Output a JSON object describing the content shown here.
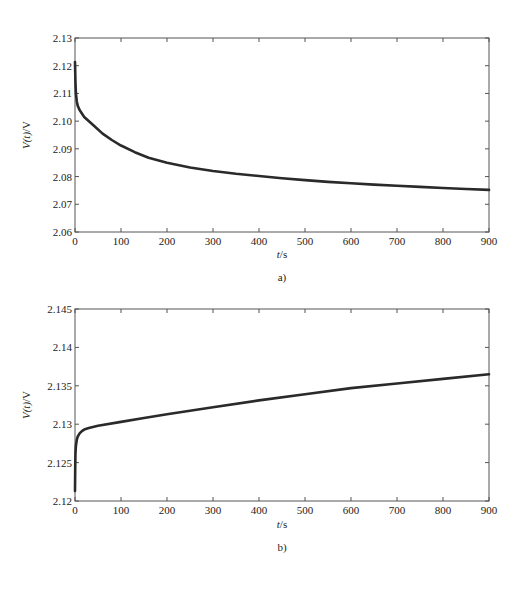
{
  "chart_data": [
    {
      "id": "a",
      "type": "line",
      "title": "",
      "caption": "a)",
      "xlabel_var": "t",
      "xlabel_unit": "/s",
      "ylabel_var": "V",
      "ylabel_arg": "(t)",
      "ylabel_unit": "/V",
      "xlim": [
        0,
        900
      ],
      "ylim": [
        2.06,
        2.13
      ],
      "xticks": [
        0,
        100,
        200,
        300,
        400,
        500,
        600,
        700,
        800,
        900
      ],
      "xtick_labels": [
        "0",
        "100",
        "200",
        "300",
        "400",
        "500",
        "600",
        "700",
        "800",
        "900"
      ],
      "yticks": [
        2.06,
        2.07,
        2.08,
        2.09,
        2.1,
        2.11,
        2.12,
        2.13
      ],
      "ytick_labels": [
        "2.06",
        "2.07",
        "2.08",
        "2.09",
        "2.10",
        "2.11",
        "2.12",
        "2.13"
      ],
      "grid": false,
      "legend": null,
      "series": [
        {
          "name": "V(t)",
          "color": "#2a2a2a",
          "x": [
            0,
            1,
            2,
            4,
            6,
            10,
            20,
            40,
            60,
            80,
            100,
            130,
            160,
            200,
            250,
            300,
            350,
            400,
            450,
            500,
            550,
            600,
            650,
            700,
            750,
            800,
            850,
            900
          ],
          "y": [
            2.1213,
            2.114,
            2.11,
            2.107,
            2.1055,
            2.104,
            2.1015,
            2.0985,
            2.0955,
            2.0932,
            2.0912,
            2.0888,
            2.0868,
            2.085,
            2.0833,
            2.082,
            2.081,
            2.0802,
            2.0794,
            2.0787,
            2.0781,
            2.0776,
            2.0771,
            2.0767,
            2.0763,
            2.0759,
            2.0755,
            2.0752
          ]
        }
      ]
    },
    {
      "id": "b",
      "type": "line",
      "title": "",
      "caption": "b)",
      "xlabel_var": "t",
      "xlabel_unit": "/s",
      "ylabel_var": "V",
      "ylabel_arg": "(t)",
      "ylabel_unit": "/V",
      "xlim": [
        0,
        900
      ],
      "ylim": [
        2.12,
        2.145
      ],
      "xticks": [
        0,
        100,
        200,
        300,
        400,
        500,
        600,
        700,
        800,
        900
      ],
      "xtick_labels": [
        "0",
        "100",
        "200",
        "300",
        "400",
        "500",
        "600",
        "700",
        "800",
        "900"
      ],
      "yticks": [
        2.12,
        2.125,
        2.13,
        2.135,
        2.14,
        2.145
      ],
      "ytick_labels": [
        "2.12",
        "2.125",
        "2.13",
        "2.135",
        "2.14",
        "2.145"
      ],
      "grid": false,
      "legend": null,
      "series": [
        {
          "name": "V(t)",
          "color": "#2a2a2a",
          "x": [
            0,
            0.5,
            1,
            2,
            4,
            6,
            10,
            15,
            20,
            30,
            50,
            100,
            150,
            200,
            300,
            400,
            500,
            600,
            700,
            800,
            900
          ],
          "y": [
            2.1213,
            2.1245,
            2.1262,
            2.1272,
            2.128,
            2.1284,
            2.1288,
            2.1291,
            2.1293,
            2.1295,
            2.1298,
            2.1303,
            2.1308,
            2.1313,
            2.1322,
            2.1331,
            2.1339,
            2.1347,
            2.1353,
            2.1359,
            2.1365
          ]
        }
      ]
    }
  ]
}
